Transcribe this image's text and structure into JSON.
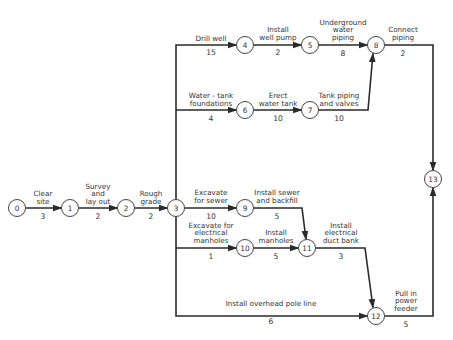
{
  "diagram": {
    "type": "activity-on-arrow network (CPM)",
    "nodes": [
      {
        "id": "0",
        "label": "0",
        "x": 17,
        "y": 208
      },
      {
        "id": "1",
        "label": "1",
        "x": 70,
        "y": 208
      },
      {
        "id": "2",
        "label": "2",
        "x": 126,
        "y": 208
      },
      {
        "id": "3",
        "label": "3",
        "x": 176,
        "y": 208
      },
      {
        "id": "4",
        "label": "4",
        "x": 245,
        "y": 45
      },
      {
        "id": "5",
        "label": "5",
        "x": 310,
        "y": 45
      },
      {
        "id": "6",
        "label": "6",
        "x": 245,
        "y": 110
      },
      {
        "id": "7",
        "label": "7",
        "x": 310,
        "y": 110
      },
      {
        "id": "8",
        "label": "8",
        "x": 376,
        "y": 45
      },
      {
        "id": "9",
        "label": "9",
        "x": 245,
        "y": 178
      },
      {
        "id": "10",
        "label": "10",
        "x": 245,
        "y": 248
      },
      {
        "id": "11",
        "label": "11",
        "x": 307,
        "y": 248
      },
      {
        "id": "12",
        "label": "12",
        "x": 376,
        "y": 316
      },
      {
        "id": "13",
        "label": "13",
        "x": 433,
        "y": 179
      }
    ],
    "activities": [
      {
        "from": "0",
        "to": "1",
        "label_lines": [
          "Clear",
          "site"
        ],
        "duration": "3"
      },
      {
        "from": "1",
        "to": "2",
        "label_lines": [
          "Survey",
          "and",
          "lay out"
        ],
        "duration": "2"
      },
      {
        "from": "2",
        "to": "3",
        "label_lines": [
          "Rough",
          "grade"
        ],
        "duration": "2"
      },
      {
        "from": "3",
        "to": "4",
        "label_lines": [
          "Drill well"
        ],
        "duration": "15"
      },
      {
        "from": "4",
        "to": "5",
        "label_lines": [
          "Install",
          "well pump"
        ],
        "duration": "2"
      },
      {
        "from": "5",
        "to": "8",
        "label_lines": [
          "Underground",
          "water",
          "piping"
        ],
        "duration": "8"
      },
      {
        "from": "3",
        "to": "6",
        "label_lines": [
          "Water - tank",
          "foundations"
        ],
        "duration": "4"
      },
      {
        "from": "6",
        "to": "7",
        "label_lines": [
          "Erect",
          "water tank"
        ],
        "duration": "10"
      },
      {
        "from": "7",
        "to": "8",
        "label_lines": [
          "Tank piping",
          "and valves"
        ],
        "duration": "10"
      },
      {
        "from": "8",
        "to": "13",
        "label_lines": [
          "Connect",
          "piping"
        ],
        "duration": "2"
      },
      {
        "from": "3",
        "to": "9",
        "label_lines": [
          "Excavate",
          "for sewer"
        ],
        "duration": "10"
      },
      {
        "from": "9",
        "to": "11",
        "label_lines": [
          "Install sewer",
          "and backfill"
        ],
        "duration": "5"
      },
      {
        "from": "3",
        "to": "10",
        "label_lines": [
          "Excavate for",
          "electrical",
          "manholes"
        ],
        "duration": "1"
      },
      {
        "from": "10",
        "to": "11",
        "label_lines": [
          "Install",
          "manholes"
        ],
        "duration": "5"
      },
      {
        "from": "11",
        "to": "12",
        "label_lines": [
          "Install",
          "electrical",
          "duct bank"
        ],
        "duration": "3"
      },
      {
        "from": "3",
        "to": "12",
        "label_lines": [
          "Install overhead pole line"
        ],
        "duration": "6"
      },
      {
        "from": "12",
        "to": "13",
        "label_lines": [
          "Pull in",
          "power",
          "feeder"
        ],
        "duration": "5"
      }
    ]
  }
}
